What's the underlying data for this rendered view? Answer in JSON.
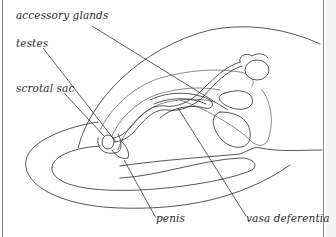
{
  "diagram": {
    "labels": {
      "accessory_glands": "accessory glands",
      "testes": "testes",
      "scrotal_sac": "scrotal sac",
      "penis": "penis",
      "vasa_deferentia": "vasa deferentia"
    },
    "colors": {
      "line": "#2a2a2a",
      "background": "#ffffff",
      "border": "#8a8a8a"
    }
  }
}
